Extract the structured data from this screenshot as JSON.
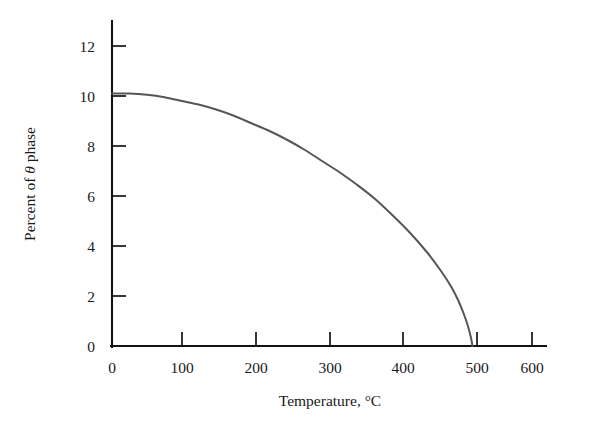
{
  "chart_data": {
    "type": "line",
    "title": "",
    "subtitle": "",
    "xlabel": "Temperature, °C",
    "ylabel": "Percent of θ phase",
    "ylabel_parts": {
      "prefix": "Percent of ",
      "symbol": "θ",
      "suffix": " phase"
    },
    "xlim": [
      0,
      600
    ],
    "ylim": [
      0,
      12
    ],
    "xticks": [
      0,
      100,
      200,
      300,
      400,
      500,
      600
    ],
    "yticks": [
      0,
      2,
      4,
      6,
      8,
      10,
      12
    ],
    "xtick_labels": [
      "0",
      "100",
      "200",
      "300",
      "400",
      "500",
      "600"
    ],
    "ytick_labels": [
      "0",
      "2",
      "4",
      "6",
      "8",
      "10",
      "12"
    ],
    "grid": false,
    "legend": false,
    "legend_position": "none",
    "series": [
      {
        "name": "Percent of theta phase",
        "color": "#55565a",
        "x": [
          0,
          25,
          50,
          75,
          100,
          125,
          150,
          175,
          200,
          225,
          250,
          275,
          300,
          325,
          350,
          375,
          400,
          425,
          450,
          470,
          485,
          495,
          503,
          509,
          513,
          515
        ],
        "y": [
          10.1,
          10.1,
          10.05,
          9.95,
          9.8,
          9.65,
          9.45,
          9.2,
          8.9,
          8.6,
          8.25,
          7.85,
          7.4,
          6.95,
          6.45,
          5.9,
          5.25,
          4.55,
          3.75,
          3.0,
          2.35,
          1.8,
          1.25,
          0.75,
          0.3,
          0.0
        ]
      }
    ],
    "annotations": []
  },
  "colors": {
    "axis": "#141414",
    "curve": "#55565a",
    "text": "#1a1a1a",
    "background": "#ffffff"
  }
}
